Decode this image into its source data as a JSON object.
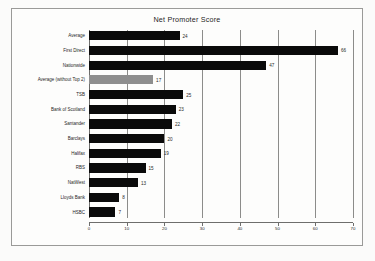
{
  "chart_data": {
    "type": "bar",
    "orientation": "horizontal",
    "title": "Net Promoter Score",
    "xlabel": "",
    "ylabel": "",
    "xlim": [
      0,
      70
    ],
    "xticks": [
      0,
      10,
      20,
      30,
      40,
      50,
      60,
      70
    ],
    "grid": true,
    "legend": false,
    "categories": [
      "Average",
      "First Direct",
      "Nationwide",
      "Average (without Top 2)",
      "TSB",
      "Bank of Scotland",
      "Santander",
      "Barclays",
      "Halifax",
      "RBS",
      "NatWest",
      "Lloyds Bank",
      "HSBC"
    ],
    "values": [
      24,
      66,
      47,
      17,
      25,
      23,
      22,
      20,
      19,
      15,
      13,
      8,
      7
    ],
    "bar_colors": [
      "#0a0a0a",
      "#0a0a0a",
      "#0a0a0a",
      "#8e8e8e",
      "#0a0a0a",
      "#0a0a0a",
      "#0a0a0a",
      "#0a0a0a",
      "#0a0a0a",
      "#0a0a0a",
      "#0a0a0a",
      "#0a0a0a",
      "#0a0a0a"
    ],
    "data_labels": [
      "24",
      "66",
      "47",
      "17",
      "25",
      "23",
      "22",
      "20",
      "19",
      "15",
      "13",
      "8",
      "7"
    ],
    "colors": {
      "bar_default": "#0a0a0a",
      "bar_highlight": "#8e8e8e",
      "gridline": "#8c8c8a",
      "border": "#9a9a98",
      "background": "#fdfdfc",
      "text": "#1d1d1d"
    }
  }
}
